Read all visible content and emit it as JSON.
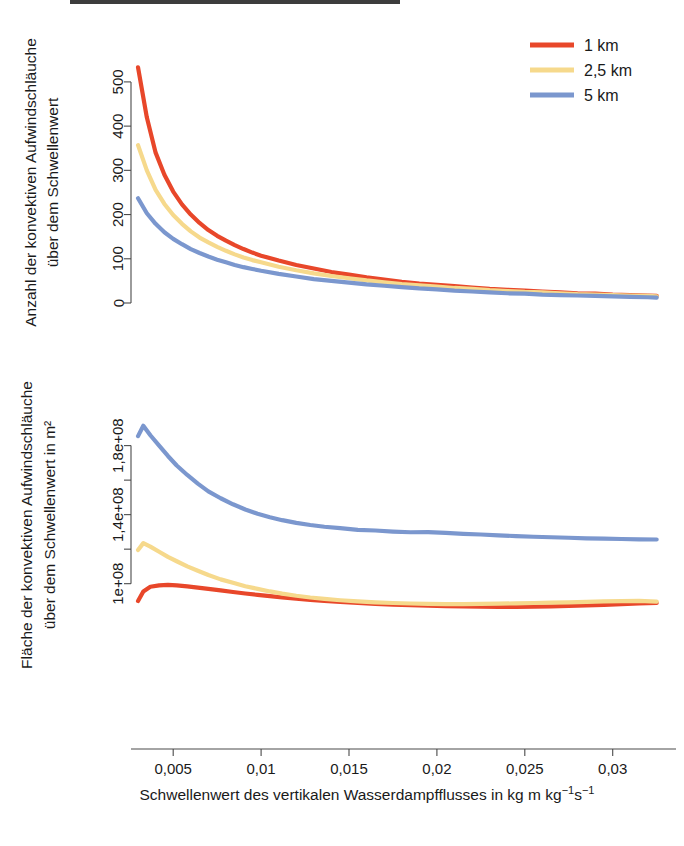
{
  "figure": {
    "background": "#ffffff",
    "colors": {
      "series_1km": "#E8472A",
      "series_25km": "#F6D98C",
      "series_5km": "#7B97CE",
      "axis": "#4a4a4a",
      "text": "#1a1a1a"
    }
  },
  "legend": {
    "position": "top-right",
    "entries": [
      {
        "label": "1 km",
        "color": "#E8472A",
        "name": "legend-item-1km"
      },
      {
        "label": "2,5 km",
        "color": "#F6D98C",
        "name": "legend-item-25km"
      },
      {
        "label": "5 km",
        "color": "#7B97CE",
        "name": "legend-item-5km"
      }
    ]
  },
  "xaxis": {
    "label": "Schwellenwert des vertikalen Wasserdampfflusses in kg m kg⁻¹s⁻¹",
    "label_plain": "Schwellenwert des vertikalen Wasserdampfflusses in kg m kg-1s-1",
    "ticks": [
      "0,005",
      "0,01",
      "0,015",
      "0,02",
      "0,025",
      "0,03"
    ],
    "tick_values": [
      0.005,
      0.01,
      0.015,
      0.02,
      0.025,
      0.03
    ],
    "range": [
      0.0026,
      0.0336
    ]
  },
  "chart_data": [
    {
      "type": "line",
      "id": "panel-top",
      "title": "",
      "xlabel": "",
      "ylabel": "Anzahl der konvektiven Aufwindschläuche über dem Schwellenwert",
      "ylabel_line1": "Anzahl der konvektiven Aufwindschläuche",
      "ylabel_line2": "über dem Schwellenwert",
      "yticks": [
        "0",
        "100",
        "200",
        "300",
        "400",
        "500"
      ],
      "ytick_values": [
        0,
        100,
        200,
        300,
        400,
        500
      ],
      "ylim": [
        0,
        545
      ],
      "xlim": [
        0.0026,
        0.0336
      ],
      "grid": false,
      "legend": "top-right",
      "x": [
        0.003,
        0.0035,
        0.004,
        0.0045,
        0.005,
        0.0055,
        0.006,
        0.0065,
        0.007,
        0.0075,
        0.008,
        0.0085,
        0.009,
        0.0095,
        0.01,
        0.011,
        0.012,
        0.013,
        0.014,
        0.015,
        0.016,
        0.017,
        0.018,
        0.019,
        0.02,
        0.021,
        0.022,
        0.023,
        0.024,
        0.025,
        0.026,
        0.027,
        0.028,
        0.029,
        0.03,
        0.031,
        0.032,
        0.0325
      ],
      "series": [
        {
          "name": "1 km",
          "color": "#E8472A",
          "values": [
            533,
            420,
            340,
            290,
            252,
            223,
            200,
            181,
            165,
            152,
            141,
            131,
            122,
            114,
            107,
            96,
            86,
            78,
            70,
            64,
            58,
            53,
            48,
            44,
            41,
            38,
            35,
            32,
            30,
            28,
            26,
            24,
            22,
            21,
            19,
            18,
            17,
            16
          ]
        },
        {
          "name": "2,5 km",
          "color": "#F6D98C",
          "values": [
            357,
            300,
            256,
            224,
            199,
            179,
            162,
            148,
            137,
            127,
            118,
            110,
            103,
            97,
            92,
            82,
            74,
            67,
            61,
            56,
            51,
            47,
            43,
            40,
            37,
            34,
            32,
            29,
            27,
            25,
            24,
            22,
            20,
            19,
            18,
            17,
            16,
            15
          ]
        },
        {
          "name": "5 km",
          "color": "#7B97CE",
          "values": [
            237,
            203,
            179,
            160,
            145,
            133,
            122,
            113,
            105,
            98,
            92,
            86,
            81,
            77,
            73,
            66,
            60,
            54,
            50,
            46,
            42,
            39,
            36,
            33,
            31,
            28,
            26,
            24,
            22,
            21,
            19,
            18,
            17,
            16,
            15,
            14,
            13,
            12
          ]
        }
      ]
    },
    {
      "type": "line",
      "id": "panel-bottom",
      "title": "",
      "xlabel": "Schwellenwert des vertikalen Wasserdampfflusses in kg m kg⁻¹s⁻¹",
      "ylabel": "Fläche der konvektiven Aufwindschläuche über dem Schwellenwert in m²",
      "ylabel_line1": "Fläche der konvektiven Aufwindschläuche",
      "ylabel_line2": "über dem Schwellenwert in m²",
      "yticks": [
        "1e+08",
        "1,4e+08",
        "1,8e+08"
      ],
      "ytick_values": [
        100000000,
        140000000,
        180000000
      ],
      "ylim": [
        72000000,
        196000000
      ],
      "xlim": [
        0.0026,
        0.0336
      ],
      "grid": false,
      "x": [
        0.003,
        0.0033,
        0.0037,
        0.0042,
        0.0047,
        0.0052,
        0.0058,
        0.0064,
        0.007,
        0.0077,
        0.0084,
        0.0091,
        0.0098,
        0.0105,
        0.0112,
        0.012,
        0.0128,
        0.0136,
        0.0145,
        0.0155,
        0.0165,
        0.0175,
        0.0185,
        0.0195,
        0.0205,
        0.0215,
        0.0225,
        0.0235,
        0.0245,
        0.0255,
        0.0265,
        0.0275,
        0.0285,
        0.0295,
        0.0305,
        0.0315,
        0.0325
      ],
      "series": [
        {
          "name": "1 km",
          "color": "#E8472A",
          "values": [
            90000000,
            95500000,
            98200000,
            99000000,
            99300000,
            99000000,
            98400000,
            97700000,
            97000000,
            96100000,
            95200000,
            94300000,
            93500000,
            92800000,
            92100000,
            91300000,
            90600000,
            90000000,
            89400000,
            88800000,
            88300000,
            87900000,
            87500000,
            87200000,
            87000000,
            86800000,
            86700000,
            86600000,
            86600000,
            86700000,
            86900000,
            87100000,
            87400000,
            87700000,
            88100000,
            88500000,
            88800000
          ]
        },
        {
          "name": "2,5 km",
          "color": "#F6D98C",
          "values": [
            119500000,
            123500000,
            121500000,
            118500000,
            115500000,
            113000000,
            110000000,
            107500000,
            105000000,
            102500000,
            100500000,
            98500000,
            97000000,
            95500000,
            94200000,
            93000000,
            92000000,
            91200000,
            90400000,
            89700000,
            89200000,
            88800000,
            88500000,
            88300000,
            88200000,
            88200000,
            88300000,
            88400000,
            88600000,
            88800000,
            89000000,
            89200000,
            89500000,
            89700000,
            89900000,
            90000000,
            89600000
          ]
        },
        {
          "name": "5 km",
          "color": "#7B97CE",
          "values": [
            185500000,
            191500000,
            186000000,
            180000000,
            174000000,
            168500000,
            163000000,
            158000000,
            153500000,
            149500000,
            146000000,
            143000000,
            140500000,
            138500000,
            136800000,
            135200000,
            134000000,
            133000000,
            132200000,
            131200000,
            130800000,
            130200000,
            129800000,
            129900000,
            129400000,
            128900000,
            128500000,
            128000000,
            127600000,
            127200000,
            126900000,
            126600000,
            126300000,
            126100000,
            125900000,
            125700000,
            125600000
          ]
        }
      ]
    }
  ]
}
